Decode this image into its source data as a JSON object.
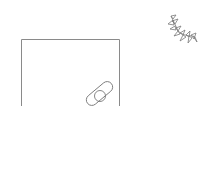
{
  "canvas": {
    "width": 218,
    "height": 171,
    "background": "#ffffff",
    "stroke_color": "#8a8a8a"
  },
  "shapes": [
    {
      "name": "open-rectangle",
      "description": "box outline with open bottom"
    },
    {
      "name": "capsule-with-circle",
      "description": "tilted pill shape overlapping a circle"
    },
    {
      "name": "leaf-sprig",
      "description": "curved sprig of small pointed leaves"
    }
  ]
}
